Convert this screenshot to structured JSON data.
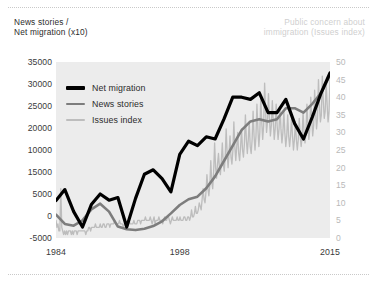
{
  "header": {
    "left_title": "News stories /\nNet migration (x10)",
    "right_title": "Public concern about\nimmigration (Issues index)"
  },
  "legend": {
    "items": [
      {
        "label": "Net migration",
        "color": "#000000",
        "thickness": 3.2
      },
      {
        "label": "News stories",
        "color": "#7d7d7d",
        "thickness": 2.6
      },
      {
        "label": "Issues index",
        "color": "#bdbdbd",
        "thickness": 2.4
      }
    ]
  },
  "chart_data": {
    "type": "line",
    "title": "",
    "xlabel": "",
    "ylabel": "News stories / Net migration (x10)",
    "y2label": "Public concern about immigration (Issues index)",
    "grid": false,
    "legend_position": "inside-top-left",
    "xlim": [
      1984,
      2015
    ],
    "xticks": [
      "1984",
      "1998",
      "2015"
    ],
    "xtick_values": [
      1984,
      1998,
      2015
    ],
    "ylim": [
      -5000,
      35000
    ],
    "yticks": [
      "35000",
      "30000",
      "25000",
      "20000",
      "10000",
      "15000",
      "5000",
      "0",
      "-5000"
    ],
    "ytick_values": [
      35000,
      30000,
      25000,
      20000,
      15000,
      10000,
      5000,
      0,
      -5000
    ],
    "ytick_note": "Left axis labels appear in the source with 10000 printed above 15000 (transposed in the original artwork); reproduced verbatim.",
    "y2lim": [
      0,
      50
    ],
    "y2ticks": [
      "50",
      "45",
      "40",
      "35",
      "30",
      "25",
      "20",
      "15",
      "10",
      "5",
      "0"
    ],
    "y2tick_values": [
      50,
      45,
      40,
      35,
      30,
      25,
      20,
      15,
      10,
      5,
      0
    ],
    "series": [
      {
        "name": "Net migration",
        "axis": "left",
        "color": "#000000",
        "x": [
          1984,
          1985,
          1986,
          1987,
          1988,
          1989,
          1990,
          1991,
          1992,
          1993,
          1994,
          1995,
          1996,
          1997,
          1998,
          1999,
          2000,
          2001,
          2002,
          2003,
          2004,
          2005,
          2006,
          2007,
          2008,
          2009,
          2010,
          2011,
          2012,
          2013,
          2014,
          2015
        ],
        "values": [
          3500,
          6000,
          1000,
          -2500,
          2600,
          5000,
          3600,
          4200,
          -2500,
          4000,
          9500,
          10500,
          8500,
          5500,
          14000,
          17000,
          16000,
          18000,
          17500,
          22000,
          27000,
          27000,
          26500,
          28000,
          23500,
          23500,
          26500,
          21000,
          17500,
          22500,
          28000,
          32500
        ]
      },
      {
        "name": "News stories",
        "axis": "left",
        "color": "#7d7d7d",
        "x": [
          1984,
          1985,
          1986,
          1987,
          1988,
          1989,
          1990,
          1991,
          1992,
          1993,
          1994,
          1995,
          1996,
          1997,
          1998,
          1999,
          2000,
          2001,
          2002,
          2003,
          2004,
          2005,
          2006,
          2007,
          2008,
          2009,
          2010,
          2011,
          2012,
          2013,
          2014,
          2015
        ],
        "values": [
          300,
          -1800,
          -2200,
          -1000,
          1500,
          2800,
          1000,
          -2400,
          -3000,
          -3200,
          -2900,
          -2300,
          -1200,
          600,
          2500,
          3800,
          4400,
          6300,
          9000,
          12500,
          16000,
          19500,
          21500,
          22000,
          21500,
          22000,
          24500,
          24500,
          23500,
          25500,
          28000,
          32000
        ]
      },
      {
        "name": "Issues index",
        "axis": "right",
        "color": "#bdbdbd",
        "note": "Monthly series, highly volatile; near zero until 1999 then rising with large spikes.",
        "x_start": 1984,
        "x_end": 2015,
        "values": [
          5,
          3,
          4,
          2,
          2,
          14,
          3,
          2,
          1,
          2,
          1,
          2,
          1,
          2,
          2,
          2,
          1,
          2,
          1,
          2,
          2,
          2,
          1,
          2,
          2,
          2,
          2,
          2,
          2,
          2,
          2,
          1,
          2,
          2,
          3,
          3,
          2,
          3,
          3,
          3,
          3,
          4,
          3,
          3,
          3,
          3,
          4,
          3,
          3,
          4,
          4,
          3,
          3,
          4,
          4,
          4,
          3,
          4,
          4,
          4,
          4,
          5,
          4,
          4,
          4,
          4,
          5,
          4,
          4,
          4,
          3,
          4,
          4,
          4,
          4,
          4,
          5,
          4,
          4,
          4,
          4,
          5,
          4,
          4,
          4,
          5,
          5,
          5,
          4,
          5,
          5,
          5,
          5,
          6,
          5,
          5,
          5,
          5,
          6,
          5,
          4,
          5,
          6,
          4,
          5,
          5,
          5,
          6,
          5,
          5,
          5,
          4,
          5,
          6,
          5,
          5,
          6,
          6,
          5,
          4,
          5,
          6,
          5,
          5,
          5,
          5,
          6,
          5,
          5,
          6,
          5,
          5,
          5,
          6,
          6,
          5,
          5,
          6,
          6,
          5,
          6,
          8,
          6,
          6,
          7,
          9,
          7,
          7,
          8,
          10,
          9,
          8,
          11,
          14,
          11,
          10,
          13,
          18,
          14,
          12,
          15,
          22,
          16,
          14,
          19,
          27,
          20,
          17,
          21,
          24,
          20,
          18,
          22,
          27,
          21,
          19,
          23,
          31,
          24,
          20,
          24,
          29,
          23,
          21,
          25,
          33,
          26,
          22,
          26,
          30,
          24,
          22,
          26,
          31,
          25,
          23,
          27,
          35,
          28,
          24,
          28,
          33,
          26,
          24,
          28,
          36,
          29,
          25,
          29,
          38,
          31,
          26,
          30,
          40,
          33,
          28,
          32,
          44,
          36,
          30,
          33,
          41,
          34,
          29,
          32,
          39,
          33,
          28,
          31,
          38,
          32,
          28,
          31,
          37,
          31,
          27,
          30,
          36,
          30,
          26,
          29,
          35,
          29,
          26,
          29,
          34,
          29,
          25,
          28,
          33,
          28,
          25,
          28,
          34,
          29,
          26,
          29,
          36,
          30,
          27,
          30,
          38,
          32,
          28,
          31,
          40,
          34,
          29,
          32,
          42,
          36,
          31,
          34,
          45,
          38,
          33,
          35,
          46,
          39,
          34,
          36,
          44,
          38,
          33,
          36,
          45
        ]
      }
    ]
  }
}
